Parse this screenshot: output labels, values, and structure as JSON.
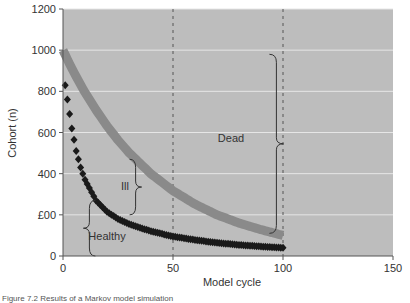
{
  "chart_data": {
    "type": "line",
    "title": "",
    "xlabel": "Model cycle",
    "ylabel": "Cohort (n)",
    "xlim": [
      0,
      150
    ],
    "ylim": [
      0,
      1200
    ],
    "x_ticks": [
      0,
      50,
      100,
      150
    ],
    "y_ticks": [
      0,
      200,
      400,
      600,
      800,
      1000,
      1200
    ],
    "y_tick_labels": [
      "0",
      "£00",
      "400",
      "600",
      "800",
      "1000",
      "1200"
    ],
    "grid": {
      "horizontal": true,
      "vertical_dashed_at": [
        50,
        100
      ]
    },
    "legend": null,
    "x": [
      0,
      2,
      4,
      6,
      8,
      10,
      15,
      20,
      25,
      30,
      40,
      50,
      60,
      70,
      80,
      90,
      100
    ],
    "series": [
      {
        "name": "Ill + Healthy (alive)",
        "color": "#8a8a8a",
        "marker": "thick-line",
        "values": [
          1000,
          955,
          912,
          871,
          832,
          795,
          710,
          632,
          563,
          502,
          399,
          317,
          252,
          200,
          160,
          128,
          100
        ]
      },
      {
        "name": "Healthy",
        "color": "#1a1a1a",
        "marker": "diamond",
        "values": [
          900,
          760,
          620,
          510,
          430,
          370,
          270,
          215,
          180,
          155,
          120,
          95,
          78,
          64,
          54,
          46,
          40
        ]
      }
    ],
    "annotations": [
      {
        "label": "Dead",
        "bracket_x": 97,
        "y_range": [
          110,
          980
        ]
      },
      {
        "label": "Ill",
        "bracket_x": 33,
        "y_range": [
          200,
          470
        ]
      },
      {
        "label": "Healthy",
        "bracket_x": 12,
        "y_range": [
          0,
          270
        ]
      }
    ]
  },
  "axes": {
    "xlabel": "Model cycle",
    "ylabel": "Cohort (n)",
    "x_tick_labels": [
      "0",
      "50",
      "100",
      "150"
    ],
    "y_tick_labels": [
      "0",
      "£00",
      "400",
      "600",
      "800",
      "1000",
      "1200"
    ]
  },
  "annotations": {
    "dead": "Dead",
    "ill": "Ill",
    "healthy": "Healthy"
  },
  "colors": {
    "plot_bg": "#bdbdbd",
    "gridline": "#e6e6e6",
    "ill_curve": "#8a8a8a",
    "healthy_curve": "#1a1a1a",
    "axis": "#555555"
  },
  "caption": "Figure 7.2 Results of a Markov model simulation"
}
